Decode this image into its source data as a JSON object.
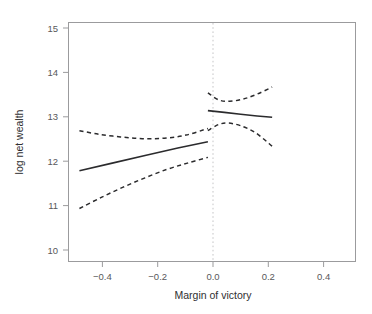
{
  "chart_data": {
    "type": "line",
    "title": "",
    "subtitle": "",
    "xlabel": "Margin of victory",
    "ylabel": "log net wealth",
    "xlim": [
      -0.51,
      0.54
    ],
    "ylim": [
      9.78,
      15.15
    ],
    "xticks": [
      -0.4,
      -0.2,
      0.0,
      0.2,
      0.4
    ],
    "xticklabels": [
      "−0.4",
      "−0.2",
      "0.0",
      "0.2",
      "0.4"
    ],
    "yticks": [
      10,
      11,
      12,
      13,
      14,
      15
    ],
    "yticklabels": [
      "10",
      "11",
      "12",
      "13",
      "14",
      "15"
    ],
    "grid": false,
    "legend": null,
    "annotations": [
      {
        "name": "cutoff-line",
        "type": "vline",
        "x": 0.0,
        "style": "dotted",
        "color": "#b9b9bb"
      }
    ],
    "colors": {
      "fit_line": "#2b2b2d",
      "confidence_band": "#2b2b2d",
      "axis": "#9b9b9d",
      "cutoff": "#c2c2c4",
      "text": "#3a3a3a",
      "background": "#ffffff"
    },
    "series": [
      {
        "name": "fit-left",
        "style": "solid",
        "x": [
          -0.47,
          -0.35,
          -0.23,
          -0.11,
          0.0
        ],
        "y": [
          11.82,
          11.99,
          12.16,
          12.33,
          12.47
        ]
      },
      {
        "name": "fit-right",
        "style": "solid",
        "x": [
          0.0,
          0.06,
          0.12,
          0.18,
          0.235
        ],
        "y": [
          13.17,
          13.13,
          13.09,
          13.05,
          13.02
        ]
      },
      {
        "name": "ci-upper-left",
        "style": "dashed",
        "x": [
          -0.47,
          -0.4,
          -0.32,
          -0.24,
          -0.16,
          -0.08,
          0.0
        ],
        "y": [
          12.72,
          12.64,
          12.58,
          12.54,
          12.55,
          12.62,
          12.77
        ]
      },
      {
        "name": "ci-lower-left",
        "style": "dashed",
        "x": [
          -0.47,
          -0.39,
          -0.31,
          -0.23,
          -0.15,
          -0.075,
          0.0
        ],
        "y": [
          10.97,
          11.22,
          11.45,
          11.66,
          11.85,
          11.99,
          12.12
        ]
      },
      {
        "name": "ci-upper-right",
        "style": "dashed",
        "x": [
          0.0,
          0.04,
          0.08,
          0.13,
          0.18,
          0.235
        ],
        "y": [
          13.57,
          13.41,
          13.38,
          13.43,
          13.54,
          13.7
        ]
      },
      {
        "name": "ci-lower-right",
        "style": "dashed",
        "x": [
          0.0,
          0.04,
          0.075,
          0.12,
          0.175,
          0.235
        ],
        "y": [
          12.72,
          12.86,
          12.89,
          12.83,
          12.67,
          12.37
        ]
      }
    ]
  },
  "axes": {
    "x_title": "Margin of victory",
    "y_title": "log net wealth"
  },
  "ticks": {
    "x": [
      "−0.4",
      "−0.2",
      "0.0",
      "0.2",
      "0.4"
    ],
    "y": [
      "10",
      "11",
      "12",
      "13",
      "14",
      "15"
    ]
  }
}
